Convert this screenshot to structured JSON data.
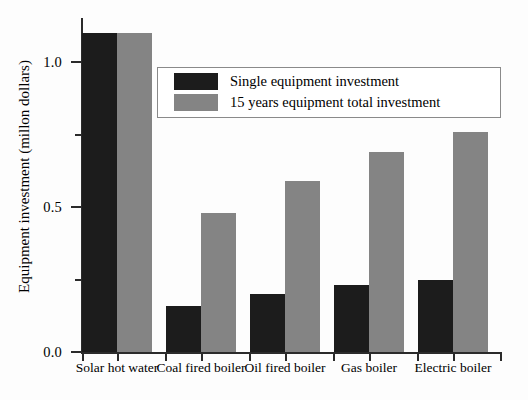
{
  "chart_data": {
    "type": "bar",
    "title": "",
    "xlabel": "",
    "ylabel": "Equipment investment (millon dollars)",
    "ylim": [
      0.0,
      1.17
    ],
    "yticks": [
      "0.0",
      "0.5",
      "1.0"
    ],
    "ytick_values": [
      0.0,
      0.5,
      1.0
    ],
    "yminor_values": [
      0.25,
      0.75
    ],
    "grid": false,
    "legend_position": "upper center",
    "categories": [
      "Solar hot water",
      "Coal fired boiler",
      "Oil fired boiler",
      "Gas boiler",
      "Electric boiler"
    ],
    "series": [
      {
        "name": "Single equipment investment",
        "color": "#1c1c1c",
        "values": [
          1.1,
          0.16,
          0.2,
          0.23,
          0.25
        ]
      },
      {
        "name": "15 years equipment total investment",
        "color": "#848484",
        "values": [
          1.1,
          0.48,
          0.59,
          0.69,
          0.76
        ]
      }
    ]
  },
  "axis": {
    "y_title": "Equipment investment (millon dollars)",
    "y_tick_labels": [
      "1.0",
      "0.5",
      "0.0"
    ]
  },
  "legend": {
    "entries": [
      {
        "label": "Single equipment investment",
        "swatch": "dark-swatch"
      },
      {
        "label": "15 years equipment total investment",
        "swatch": "gray-swatch"
      }
    ]
  }
}
